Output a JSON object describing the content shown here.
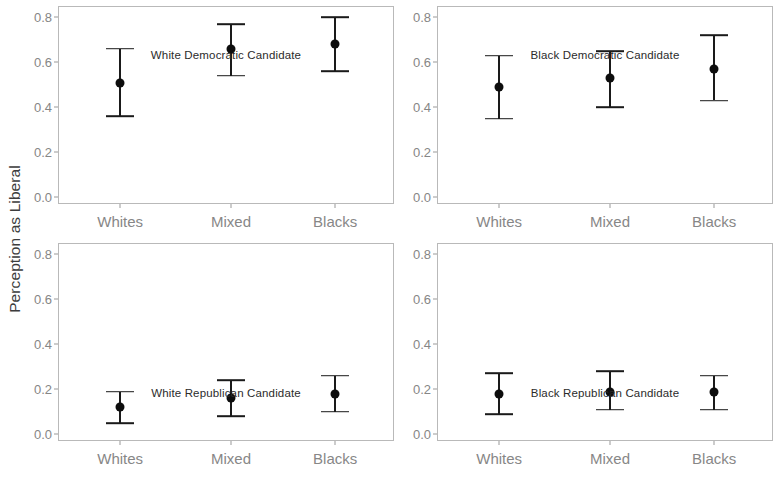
{
  "chart_data": {
    "type": "scatter",
    "title": "",
    "subtitle": "",
    "xlabel": "",
    "ylabel": "Perception as Liberal",
    "ylim": [
      -0.03,
      0.85
    ],
    "yticks": [
      0.0,
      0.2,
      0.4,
      0.6,
      0.8
    ],
    "ytick_labels": [
      "0.0",
      "0.2",
      "0.4",
      "0.6",
      "0.8"
    ],
    "categories": [
      "Whites",
      "Mixed",
      "Blacks"
    ],
    "grid": false,
    "legend": "none",
    "error_bar_style": "point_with_confidence_interval_caps",
    "panel_layout": {
      "rows": 2,
      "cols": 2
    },
    "panels": [
      {
        "caption": "White Democratic Candidate",
        "caption_y": 0.215,
        "points": [
          {
            "category": "Whites",
            "value": 0.51,
            "low": 0.36,
            "high": 0.66
          },
          {
            "category": "Mixed",
            "value": 0.66,
            "low": 0.54,
            "high": 0.77
          },
          {
            "category": "Blacks",
            "value": 0.68,
            "low": 0.56,
            "high": 0.8
          }
        ]
      },
      {
        "caption": "Black Democratic Candidate",
        "caption_y": 0.215,
        "points": [
          {
            "category": "Whites",
            "value": 0.49,
            "low": 0.35,
            "high": 0.63
          },
          {
            "category": "Mixed",
            "value": 0.53,
            "low": 0.4,
            "high": 0.65
          },
          {
            "category": "Blacks",
            "value": 0.57,
            "low": 0.43,
            "high": 0.72
          }
        ]
      },
      {
        "caption": "White Republican Candidate",
        "caption_y": 0.725,
        "points": [
          {
            "category": "Whites",
            "value": 0.12,
            "low": 0.05,
            "high": 0.19
          },
          {
            "category": "Mixed",
            "value": 0.16,
            "low": 0.08,
            "high": 0.24
          },
          {
            "category": "Blacks",
            "value": 0.18,
            "low": 0.1,
            "high": 0.26
          }
        ]
      },
      {
        "caption": "Black Republican Candidate",
        "caption_y": 0.725,
        "points": [
          {
            "category": "Whites",
            "value": 0.18,
            "low": 0.09,
            "high": 0.27
          },
          {
            "category": "Mixed",
            "value": 0.19,
            "low": 0.11,
            "high": 0.28
          },
          {
            "category": "Blacks",
            "value": 0.19,
            "low": 0.11,
            "high": 0.26
          }
        ]
      }
    ],
    "colors": {
      "point": "#0d0d0d",
      "error_bar": "#1a1a1a",
      "panel_border": "#b9b9b9",
      "tick_label": "#878787",
      "axis_title": "#3c3c3c",
      "background": "#ffffff"
    }
  }
}
